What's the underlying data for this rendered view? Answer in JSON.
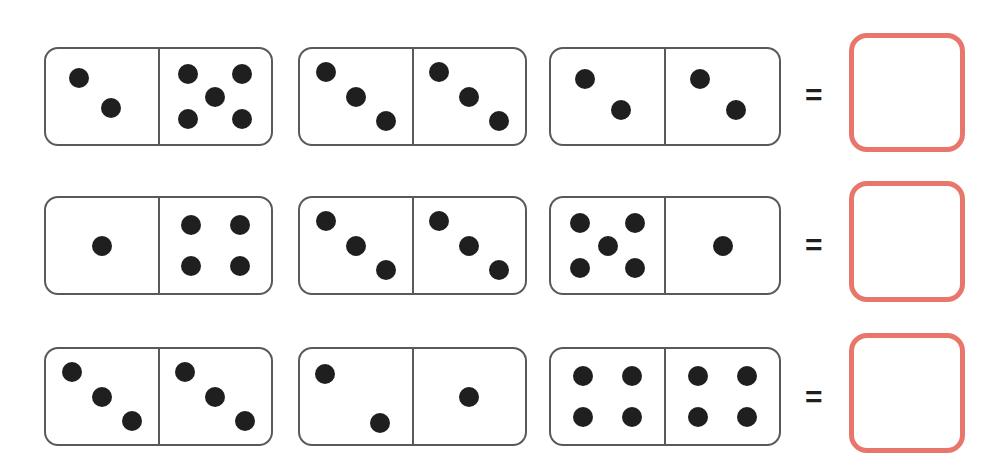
{
  "worksheet": {
    "title": "Domino addition worksheet",
    "instruction": "",
    "equals_symbol": "=",
    "colors": {
      "domino_border": "#595959",
      "pip": "#1f1f1f",
      "answer_box_border": "#e8766a",
      "background": "#ffffff"
    },
    "answer_value": ""
  },
  "rows": [
    {
      "id": "row-1",
      "top": 47,
      "dominoes": [
        {
          "id": "r1-d1",
          "left": 44,
          "width": 229,
          "height": 99,
          "left_count": 2,
          "right_count": 5,
          "left_pips": [
            [
              30,
              30
            ],
            [
              58,
              62
            ]
          ],
          "right_pips": [
            [
              26,
              26
            ],
            [
              74,
              26
            ],
            [
              50,
              50
            ],
            [
              26,
              74
            ],
            [
              74,
              74
            ]
          ]
        },
        {
          "id": "r1-d2",
          "left": 298,
          "width": 229,
          "height": 99,
          "left_count": 3,
          "right_count": 3,
          "left_pips": [
            [
              23,
              24
            ],
            [
              50,
              50
            ],
            [
              77,
              76
            ]
          ],
          "right_pips": [
            [
              23,
              24
            ],
            [
              50,
              50
            ],
            [
              77,
              76
            ]
          ]
        },
        {
          "id": "r1-d3",
          "left": 549,
          "width": 232,
          "height": 99,
          "left_count": 2,
          "right_count": 2,
          "left_pips": [
            [
              30,
              32
            ],
            [
              62,
              64
            ]
          ],
          "right_pips": [
            [
              30,
              32
            ],
            [
              62,
              64
            ]
          ]
        }
      ],
      "equals": {
        "left": 805,
        "top": 80
      },
      "answer_box": {
        "left": 849,
        "top": 33,
        "width": 116,
        "height": 119
      }
    },
    {
      "id": "row-2",
      "top": 196,
      "dominoes": [
        {
          "id": "r2-d1",
          "left": 44,
          "width": 229,
          "height": 99,
          "left_count": 1,
          "right_count": 4,
          "left_pips": [
            [
              50,
              50
            ]
          ],
          "right_pips": [
            [
              28,
              28
            ],
            [
              72,
              28
            ],
            [
              28,
              72
            ],
            [
              72,
              72
            ]
          ]
        },
        {
          "id": "r2-d2",
          "left": 298,
          "width": 229,
          "height": 99,
          "left_count": 3,
          "right_count": 3,
          "left_pips": [
            [
              23,
              24
            ],
            [
              50,
              50
            ],
            [
              77,
              76
            ]
          ],
          "right_pips": [
            [
              23,
              24
            ],
            [
              50,
              50
            ],
            [
              77,
              76
            ]
          ]
        },
        {
          "id": "r2-d3",
          "left": 549,
          "width": 232,
          "height": 99,
          "left_count": 5,
          "right_count": 1,
          "left_pips": [
            [
              26,
              26
            ],
            [
              74,
              26
            ],
            [
              50,
              50
            ],
            [
              26,
              74
            ],
            [
              74,
              74
            ]
          ],
          "right_pips": [
            [
              50,
              50
            ]
          ]
        }
      ],
      "equals": {
        "left": 805,
        "top": 230
      },
      "answer_box": {
        "left": 849,
        "top": 181,
        "width": 116,
        "height": 121
      }
    },
    {
      "id": "row-3",
      "top": 347,
      "dominoes": [
        {
          "id": "r3-d1",
          "left": 44,
          "width": 229,
          "height": 99,
          "left_count": 3,
          "right_count": 3,
          "left_pips": [
            [
              23,
              24
            ],
            [
              50,
              50
            ],
            [
              77,
              76
            ]
          ],
          "right_pips": [
            [
              23,
              24
            ],
            [
              50,
              50
            ],
            [
              77,
              76
            ]
          ]
        },
        {
          "id": "r3-d2",
          "left": 298,
          "width": 229,
          "height": 99,
          "left_count": 2,
          "right_count": 1,
          "left_pips": [
            [
              22,
              26
            ],
            [
              72,
              78
            ]
          ],
          "right_pips": [
            [
              50,
              50
            ]
          ]
        },
        {
          "id": "r3-d3",
          "left": 549,
          "width": 232,
          "height": 99,
          "left_count": 4,
          "right_count": 4,
          "left_pips": [
            [
              28,
              28
            ],
            [
              72,
              28
            ],
            [
              28,
              72
            ],
            [
              72,
              72
            ]
          ],
          "right_pips": [
            [
              28,
              28
            ],
            [
              72,
              28
            ],
            [
              28,
              72
            ],
            [
              72,
              72
            ]
          ]
        }
      ],
      "equals": {
        "left": 805,
        "top": 382
      },
      "answer_box": {
        "left": 849,
        "top": 333,
        "width": 116,
        "height": 120
      }
    }
  ]
}
